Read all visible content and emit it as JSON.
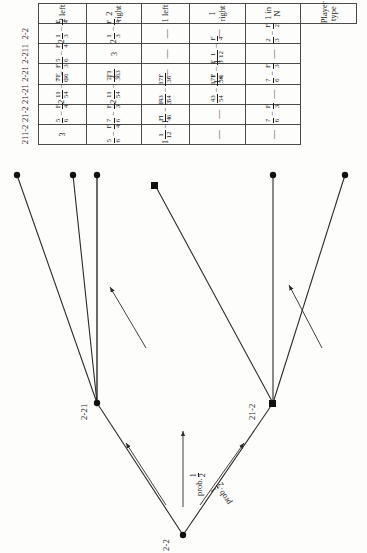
{
  "figure": {
    "type": "game-tree-with-payoff-table",
    "tree": {
      "root_label": "2-2",
      "prob_text": "prob.",
      "prob_upper_num": "1",
      "prob_upper_den": "2",
      "prob_lower_num": "1",
      "prob_lower_den": "2",
      "intermediate_upper_label": "2-21",
      "intermediate_lower_label": "21-2"
    }
  },
  "table": {
    "corner_line1": "Player",
    "corner_line2": "type",
    "column_headers": [
      "211-2",
      "21-2",
      "21-21",
      "2-21",
      "2-211",
      "2-2"
    ],
    "row_headers": [
      "2 left",
      "2 right",
      "1 left",
      "1 right",
      "1 in N"
    ],
    "cells": [
      [
        {
          "whole": "3",
          "frac": null,
          "sub": null
        },
        {
          "whole": "",
          "frac": {
            "n": "5",
            "d": "6"
          },
          "sub": {
            "n": "F",
            "d": "4"
          }
        },
        {
          "whole": "2",
          "frac": {
            "n": "11",
            "d": "54"
          },
          "sub": {
            "n": "7F",
            "d": "36"
          }
        },
        {
          "whole": "",
          "frac": {
            "n": "7",
            "d": "6"
          },
          "sub": {
            "n": "F",
            "d": "3"
          }
        },
        {
          "whole": "",
          "frac": {
            "n": "5",
            "d": "6"
          },
          "sub": {
            "n": "F",
            "d": "4"
          }
        },
        {
          "whole": "2",
          "frac": {
            "n": "1",
            "d": "3"
          },
          "sub": {
            "n": "F",
            "d": "4"
          }
        }
      ],
      [
        {
          "whole": "",
          "frac": {
            "n": "5",
            "d": "6"
          },
          "sub": {
            "n": "F",
            "d": "4"
          }
        },
        {
          "whole": "",
          "frac": {
            "n": "7",
            "d": "6"
          },
          "sub": {
            "n": "F",
            "d": "3"
          }
        },
        {
          "whole": "2",
          "frac": {
            "n": "11",
            "d": "54"
          },
          "sub": {
            "n": "7F",
            "d": "36"
          }
        },
        {
          "whole": "3",
          "frac": {
            "n": "1",
            "d": "3"
          },
          "sub": null
        },
        {
          "whole": "3",
          "frac": null,
          "sub": null
        },
        {
          "whole": "2",
          "frac": {
            "n": "1",
            "d": "3"
          },
          "sub": {
            "n": "F",
            "d": "4"
          }
        }
      ],
      [
        {
          "whole": "1",
          "frac": {
            "n": "1",
            "d": "12"
          },
          "sub": {
            "n": "F",
            "d": "4"
          }
        },
        {
          "whole": "1",
          "frac": {
            "n": "1",
            "d": "6"
          },
          "sub": {
            "n": "F",
            "d": "3"
          }
        },
        {
          "whole": "",
          "frac": {
            "n": "43",
            "d": "54"
          },
          "sub": {
            "n": "17F",
            "d": "36"
          }
        },
        {
          "dashonly": true
        },
        {
          "dashonly": true
        },
        {
          "dashonly": true
        }
      ],
      [
        {
          "dashonly": true
        },
        {
          "dashonly": true
        },
        {
          "whole": "",
          "frac": {
            "n": "43",
            "d": "54"
          },
          "sub": {
            "n": "17F",
            "d": "36"
          }
        },
        {
          "whole": "1",
          "frac": {
            "n": "1",
            "d": "6"
          },
          "sub": {
            "n": "F",
            "d": "3"
          }
        },
        {
          "whole": "1",
          "frac": {
            "n": "1",
            "d": "12"
          },
          "sub": {
            "n": "F",
            "d": "4"
          }
        },
        {
          "dashonly": true
        }
      ],
      [
        {
          "dashonly": true
        },
        {
          "whole": "",
          "frac": {
            "n": "7",
            "d": "6"
          },
          "sub": {
            "n": "F",
            "d": "3"
          }
        },
        {
          "dashonly": true
        },
        {
          "whole": "",
          "frac": {
            "n": "7",
            "d": "6"
          },
          "sub": {
            "n": "F",
            "d": "3"
          }
        },
        {
          "dashonly": true
        },
        {
          "whole": "",
          "frac": {
            "n": "2",
            "d": "3"
          },
          "sub": {
            "n": "F",
            "d": "2"
          }
        }
      ]
    ]
  }
}
